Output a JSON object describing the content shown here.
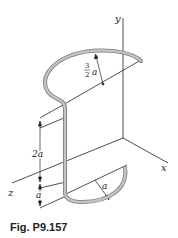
{
  "figure": {
    "caption": "Fig. P9.157",
    "axes": {
      "x": "x",
      "y": "y",
      "z": "z"
    },
    "dimensions": {
      "top_radius_num": "3",
      "top_radius_den": "2",
      "top_radius_var": "a",
      "vertical_segment": "2a",
      "lower_offset": "a",
      "bottom_radius": "a"
    },
    "colors": {
      "wire": "#b0b0b0",
      "wire_edge": "#7a7a7a",
      "lines": "#222222"
    }
  }
}
